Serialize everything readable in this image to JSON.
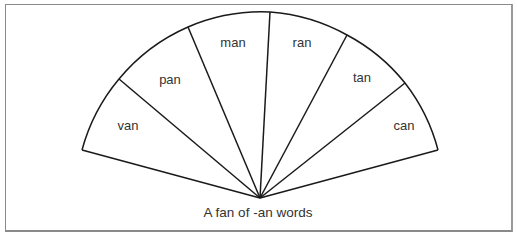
{
  "diagram": {
    "caption": "A fan of -an words",
    "center": [
      260,
      198
    ],
    "radius": 186,
    "stroke_color": "#1a1a1a",
    "segments": [
      {
        "label": "van",
        "pos": [
          128,
          130
        ]
      },
      {
        "label": "pan",
        "pos": [
          170,
          84
        ]
      },
      {
        "label": "man",
        "pos": [
          233,
          47
        ]
      },
      {
        "label": "ran",
        "pos": [
          302,
          47
        ]
      },
      {
        "label": "tan",
        "pos": [
          362,
          82
        ]
      },
      {
        "label": "can",
        "pos": [
          404,
          130
        ]
      }
    ],
    "rim_points": [
      [
        82,
        150
      ],
      [
        119,
        79
      ],
      [
        188,
        27
      ],
      [
        270,
        12
      ],
      [
        347,
        35
      ],
      [
        405,
        83
      ],
      [
        438,
        150
      ]
    ]
  }
}
